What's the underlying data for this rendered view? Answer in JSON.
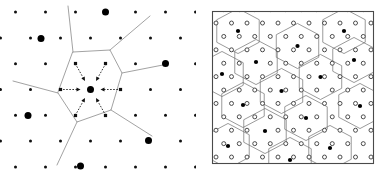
{
  "figure": {
    "background_color": "#ffffff",
    "width": 391,
    "height": 177,
    "panel_count": 2
  },
  "colors": {
    "background": "#ffffff",
    "lattice_point": "#111111",
    "marked_point": "#000000",
    "voronoi_edge_left": "#8a8a8a",
    "voronoi_edge_right": "#6e6e6e",
    "box_frame": "#4a4a4a",
    "ring_stroke": "#3a3a3a",
    "ring_fill": "#ffffff",
    "arrow": "#111111"
  },
  "left_panel": {
    "name": "nearest-neighbour-hop-diagram",
    "has_border": false,
    "center_site": {
      "x": 90.5,
      "y": 89.5,
      "r": 3.6,
      "kind": "large"
    },
    "arrow_style": {
      "dashed": true,
      "dash": "1.6 1.5",
      "head": "triangle",
      "points_to": "center"
    },
    "arrows": [
      {
        "id": "arrow-left",
        "from_x": 60.5,
        "from_y": 89.5,
        "to_x": 80.5,
        "to_y": 89.5
      },
      {
        "id": "arrow-right",
        "from_x": 120.5,
        "from_y": 89.5,
        "to_x": 100.5,
        "to_y": 89.5
      },
      {
        "id": "arrow-upper-left",
        "from_x": 75.5,
        "from_y": 64.0,
        "to_x": 85.0,
        "to_y": 81.0
      },
      {
        "id": "arrow-upper-right",
        "from_x": 105.5,
        "from_y": 64.0,
        "to_x": 96.0,
        "to_y": 81.0
      },
      {
        "id": "arrow-lower-left",
        "from_x": 75.5,
        "from_y": 115.0,
        "to_x": 85.0,
        "to_y": 98.0
      },
      {
        "id": "arrow-lower-right",
        "from_x": 105.5,
        "from_y": 115.0,
        "to_x": 96.0,
        "to_y": 98.0
      }
    ],
    "arrow_count": 6,
    "neighbour_dots": [
      {
        "x": 60.5,
        "y": 89.5
      },
      {
        "x": 120.5,
        "y": 89.5
      },
      {
        "x": 75.5,
        "y": 63.5
      },
      {
        "x": 105.5,
        "y": 63.5
      },
      {
        "x": 75.5,
        "y": 115.5
      },
      {
        "x": 105.5,
        "y": 115.5
      }
    ],
    "voronoi_cell": {
      "name": "central-hexagon",
      "vertices": [
        [
          73.0,
          52.0
        ],
        [
          110.0,
          50.0
        ],
        [
          122.0,
          73.0
        ],
        [
          111.0,
          110.0
        ],
        [
          77.0,
          122.0
        ],
        [
          58.0,
          93.0
        ]
      ]
    },
    "voronoi_edges": [
      [
        [
          73.0,
          52.0
        ],
        [
          68.0,
          6.0
        ]
      ],
      [
        [
          110.0,
          50.0
        ],
        [
          150.0,
          16.0
        ]
      ],
      [
        [
          122.0,
          73.0
        ],
        [
          168.0,
          64.0
        ]
      ],
      [
        [
          111.0,
          110.0
        ],
        [
          152.0,
          136.0
        ]
      ],
      [
        [
          77.0,
          122.0
        ],
        [
          57.0,
          165.0
        ]
      ],
      [
        [
          58.0,
          93.0
        ],
        [
          13.0,
          81.0
        ]
      ]
    ],
    "lattice": {
      "rows": 7,
      "spacing_x": 30.0,
      "spacing_y": 25.8,
      "small_dot_radius": 1.5,
      "large_dot_radius": 3.5,
      "large_dots": [
        {
          "x": 105.5,
          "y": 12.0
        },
        {
          "x": 41.0,
          "y": 38.5
        },
        {
          "x": 165.5,
          "y": 63.5
        },
        {
          "x": 28.0,
          "y": 115.5
        },
        {
          "x": 148.5,
          "y": 140.5
        },
        {
          "x": 80.5,
          "y": 166.0
        },
        {
          "x": 90.5,
          "y": 89.5
        }
      ]
    }
  },
  "right_panel": {
    "name": "voronoi-tiling-box",
    "box": {
      "x": 212,
      "y": 11,
      "width": 161,
      "height": 152
    },
    "has_border": true,
    "lattice": {
      "spacing_x": 15.5,
      "spacing_y": 13.4,
      "ring_radius": 2.0,
      "filled_dot_radius": 2.1,
      "description": "open-circle lattice sites with filled sites at Voronoi cell centres"
    },
    "cell_shape": "hexagon",
    "cell_count_approx": 20,
    "filled_centres": [
      {
        "x": 238.0,
        "y": 31.0
      },
      {
        "x": 297.5,
        "y": 46.0
      },
      {
        "x": 344.0,
        "y": 31.0
      },
      {
        "x": 256.0,
        "y": 62.0
      },
      {
        "x": 320.5,
        "y": 77.0
      },
      {
        "x": 222.0,
        "y": 74.0
      },
      {
        "x": 281.5,
        "y": 91.0
      },
      {
        "x": 354.0,
        "y": 60.0
      },
      {
        "x": 243.0,
        "y": 105.0
      },
      {
        "x": 306.0,
        "y": 118.0
      },
      {
        "x": 360.0,
        "y": 106.0
      },
      {
        "x": 265.0,
        "y": 131.0
      },
      {
        "x": 228.0,
        "y": 146.0
      },
      {
        "x": 330.0,
        "y": 148.0
      },
      {
        "x": 290.0,
        "y": 160.0
      }
    ]
  },
  "labels": {
    "left_panel_label": "",
    "right_panel_label": "",
    "caption": ""
  }
}
